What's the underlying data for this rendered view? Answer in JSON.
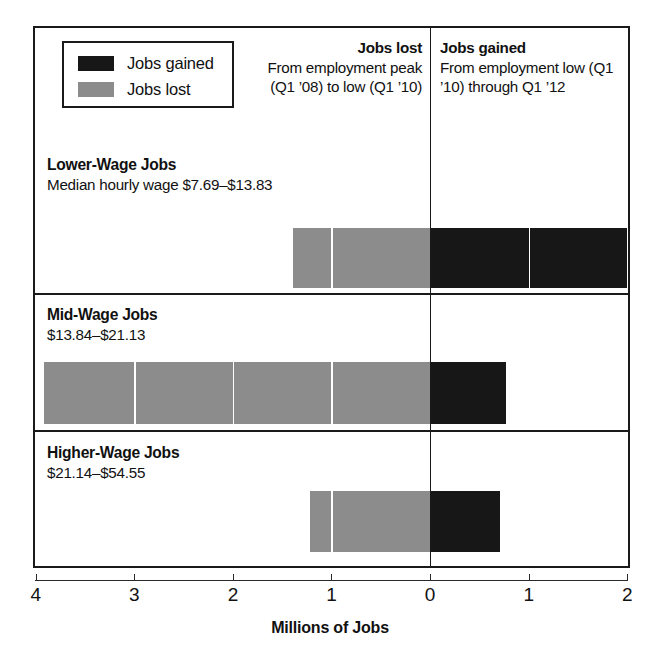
{
  "chart_data": {
    "type": "bar",
    "orientation": "horizontal",
    "title": "",
    "xlabel": "Millions of Jobs",
    "ylabel": "",
    "xlim": [
      -4,
      2
    ],
    "zero_at": 0,
    "grid": false,
    "axis_tick_labels": [
      "4",
      "3",
      "2",
      "1",
      "0",
      "1",
      "2"
    ],
    "axis_tick_values": [
      -4,
      -3,
      -2,
      -1,
      0,
      1,
      2
    ],
    "legend": {
      "position": "top-left",
      "entries": [
        {
          "label": "Jobs gained",
          "color": "#171717"
        },
        {
          "label": "Jobs lost",
          "color": "#8c8c8c"
        }
      ]
    },
    "categories": [
      "Lower-Wage Jobs",
      "Mid-Wage Jobs",
      "Higher-Wage Jobs"
    ],
    "series": [
      {
        "name": "Jobs lost",
        "color": "#8c8c8c",
        "values": [
          -1.39,
          -3.91,
          -1.22
        ]
      },
      {
        "name": "Jobs gained",
        "color": "#171717",
        "values": [
          2.0,
          0.77,
          0.71
        ]
      }
    ]
  },
  "legend": {
    "entries": [
      {
        "label": "Jobs gained",
        "swatch": "gained"
      },
      {
        "label": "Jobs lost",
        "swatch": "lost"
      }
    ]
  },
  "headers": {
    "lost": {
      "title": "Jobs lost",
      "body": "From employment peak (Q1 ’08) to low (Q1 ’10)"
    },
    "gained": {
      "title": "Jobs gained",
      "body": "From employment low (Q1 ’10) through Q1 ’12"
    }
  },
  "rows": [
    {
      "title": "Lower-Wage Jobs",
      "subtitle": "Median hourly wage $7.69–$13.83",
      "lost": -1.39,
      "gained": 2.0
    },
    {
      "title": "Mid-Wage Jobs",
      "subtitle": "$13.84–$21.13",
      "lost": -3.91,
      "gained": 0.77
    },
    {
      "title": "Higher-Wage Jobs",
      "subtitle": "$21.14–$54.55",
      "lost": -1.22,
      "gained": 0.71
    }
  ],
  "axis": {
    "ticks": [
      "4",
      "3",
      "2",
      "1",
      "0",
      "1",
      "2"
    ],
    "title": "Millions of Jobs"
  },
  "colors": {
    "gained": "#171717",
    "lost": "#8c8c8c",
    "frame": "#1a1a1a",
    "background": "#ffffff"
  }
}
